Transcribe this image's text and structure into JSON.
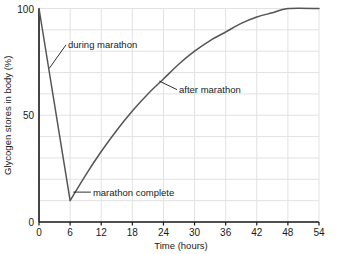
{
  "chart_data": {
    "type": "line",
    "title": "",
    "xlabel": "Time (hours)",
    "ylabel": "Glycogen stores in body (%)",
    "xlim": [
      0,
      54
    ],
    "ylim": [
      0,
      100
    ],
    "grid": true,
    "legend_position": "none",
    "xticks": [
      "0",
      "6",
      "12",
      "18",
      "24",
      "30",
      "36",
      "42",
      "48",
      "54"
    ],
    "xtick_values": [
      0,
      6,
      12,
      18,
      24,
      30,
      36,
      42,
      48,
      54
    ],
    "yticks": [
      "0",
      "50",
      "100"
    ],
    "ytick_values": [
      0,
      50,
      100
    ],
    "x_minor_step": 6,
    "y_minor_step": 10,
    "series": [
      {
        "name": "Glycogen stores",
        "x": [
          0,
          6,
          9,
          12,
          15,
          18,
          21,
          24,
          27,
          30,
          33,
          36,
          39,
          42,
          45,
          48,
          54
        ],
        "values": [
          100,
          10,
          22,
          33,
          43,
          52,
          60,
          67,
          74,
          80,
          85,
          89,
          93,
          96,
          98,
          100,
          100
        ]
      }
    ],
    "annotations": [
      {
        "id": "during-marathon",
        "text": "during marathon",
        "point_x": 2.0,
        "point_y": 72,
        "label_x": 5.6,
        "label_y": 83
      },
      {
        "id": "marathon-complete",
        "text": "marathon complete",
        "point_x": 6.6,
        "point_y": 14,
        "label_x": 10.4,
        "label_y": 14
      },
      {
        "id": "after-marathon",
        "text": "after marathon",
        "point_x": 23.2,
        "point_y": 66,
        "label_x": 27.0,
        "label_y": 62
      }
    ]
  },
  "colors": {
    "curve": "#555555",
    "axis": "#1a1a1a",
    "grid": "#e2e2e2",
    "text": "#1a1a1a",
    "background": "#ffffff"
  }
}
